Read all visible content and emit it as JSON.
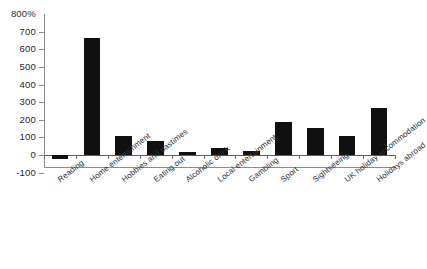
{
  "chart_data": {
    "type": "bar",
    "title": "",
    "subtitle": "",
    "xlabel": "",
    "ylabel": "",
    "unit_label": "800%",
    "ylim": [
      -100,
      800
    ],
    "ytick_values": [
      800,
      700,
      600,
      500,
      400,
      300,
      200,
      100,
      0,
      -100
    ],
    "ytick_labels": [
      "800%",
      "700",
      "600",
      "500",
      "400",
      "300",
      "200",
      "100",
      "0",
      "-100"
    ],
    "grid": false,
    "legend": "none",
    "bar_color": "#101010",
    "axis_color": "#8d8d8d",
    "categories": [
      "Reading",
      "Home entertainment",
      "Hobbies and pastimes",
      "Eating out",
      "Alcoholic drink",
      "Local entertainment",
      "Gambling",
      "Sport",
      "Sightseeing",
      "UK holiday accommodation",
      "Holidays abroad"
    ],
    "values": [
      -20,
      665,
      105,
      80,
      15,
      42,
      22,
      185,
      155,
      110,
      265
    ],
    "series": [
      {
        "name": "",
        "values": [
          -20,
          665,
          105,
          80,
          15,
          42,
          22,
          185,
          155,
          110,
          265
        ]
      }
    ]
  }
}
